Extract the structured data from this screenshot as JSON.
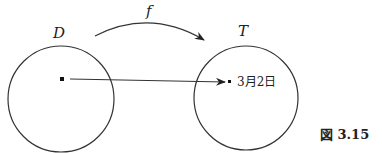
{
  "figure": {
    "caption": "図 3.15",
    "domain_label": "D",
    "codomain_label": "T",
    "function_label": "f",
    "mapped_value": "3月2日",
    "colors": {
      "stroke": "#333333",
      "background": "#ffffff"
    }
  }
}
